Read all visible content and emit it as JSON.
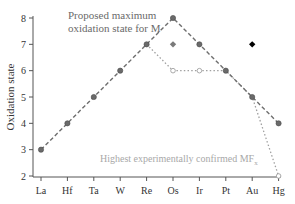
{
  "chart_data": {
    "type": "line",
    "title": "",
    "xlabel": "",
    "ylabel": "Oxidation state",
    "ylim": [
      2,
      8
    ],
    "yticks": [
      2,
      3,
      4,
      5,
      6,
      7,
      8
    ],
    "categories": [
      "La",
      "Hf",
      "Ta",
      "W",
      "Re",
      "Os",
      "Ir",
      "Pt",
      "Au",
      "Hg"
    ],
    "grid": false,
    "legend": "none (inline annotations)",
    "series": [
      {
        "name": "Proposed maximum oxidation state for M",
        "style": "dashed",
        "color": "#6e6e6e",
        "marker": "filled-circle",
        "values": [
          3,
          4,
          5,
          6,
          7,
          8,
          7,
          6,
          5,
          4
        ]
      },
      {
        "name": "Highest experimentally confirmed MFx",
        "style": "dotted",
        "color": "#a0a0a0",
        "marker": "open-circle",
        "values": [
          null,
          null,
          null,
          null,
          7,
          6,
          6,
          6,
          5,
          2
        ]
      }
    ],
    "extra_points": [
      {
        "category": "Os",
        "value": 7,
        "marker": "diamond",
        "color": "#7a7a7a"
      },
      {
        "category": "Au",
        "value": 7,
        "marker": "diamond",
        "color": "#000000"
      }
    ],
    "annotations": {
      "proposed_line1": "Proposed maximum",
      "proposed_line2": "oxidation state for M",
      "confirmed": "Highest experimentally confirmed MF",
      "confirmed_subscript": "x"
    }
  }
}
